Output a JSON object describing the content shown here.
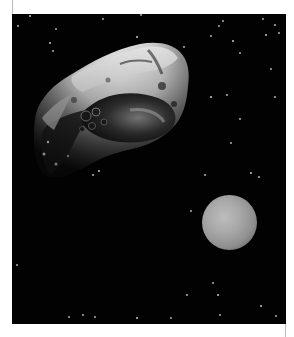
{
  "image": {
    "description": "Space scene: a large gray cratered asteroid in the upper-left and a small grayish planet/moon in the lower-right, against a black starfield",
    "background_color": "#020202",
    "frame_color": "#ffffff",
    "subjects": [
      {
        "name": "asteroid",
        "position": "upper-left",
        "color": "#d8d8d8"
      },
      {
        "name": "planet",
        "position": "lower-right",
        "color": "#a8a8a8",
        "center": [
          229,
          222
        ],
        "radius": 27
      }
    ],
    "stars": [
      [
        17,
        1
      ],
      [
        43,
        14
      ],
      [
        90,
        4
      ],
      [
        128,
        0
      ],
      [
        124,
        22
      ],
      [
        250,
        4
      ],
      [
        262,
        10
      ],
      [
        274,
        2
      ],
      [
        253,
        20
      ],
      [
        266,
        18
      ],
      [
        210,
        6
      ],
      [
        198,
        21
      ],
      [
        220,
        26
      ],
      [
        227,
        38
      ],
      [
        206,
        11
      ],
      [
        171,
        32
      ],
      [
        37,
        28
      ],
      [
        5,
        11
      ],
      [
        40,
        36
      ],
      [
        258,
        54
      ],
      [
        163,
        70
      ],
      [
        214,
        80
      ],
      [
        227,
        104
      ],
      [
        262,
        82
      ],
      [
        198,
        82
      ],
      [
        218,
        128
      ],
      [
        246,
        162
      ],
      [
        192,
        160
      ],
      [
        238,
        158
      ],
      [
        220,
        198
      ],
      [
        178,
        196
      ],
      [
        174,
        280
      ],
      [
        205,
        280
      ],
      [
        56,
        302
      ],
      [
        70,
        300
      ],
      [
        82,
        302
      ],
      [
        124,
        303
      ],
      [
        158,
        303
      ],
      [
        207,
        300
      ],
      [
        263,
        301
      ],
      [
        248,
        291
      ],
      [
        200,
        268
      ],
      [
        4,
        250
      ],
      [
        80,
        160
      ],
      [
        86,
        156
      ]
    ]
  }
}
